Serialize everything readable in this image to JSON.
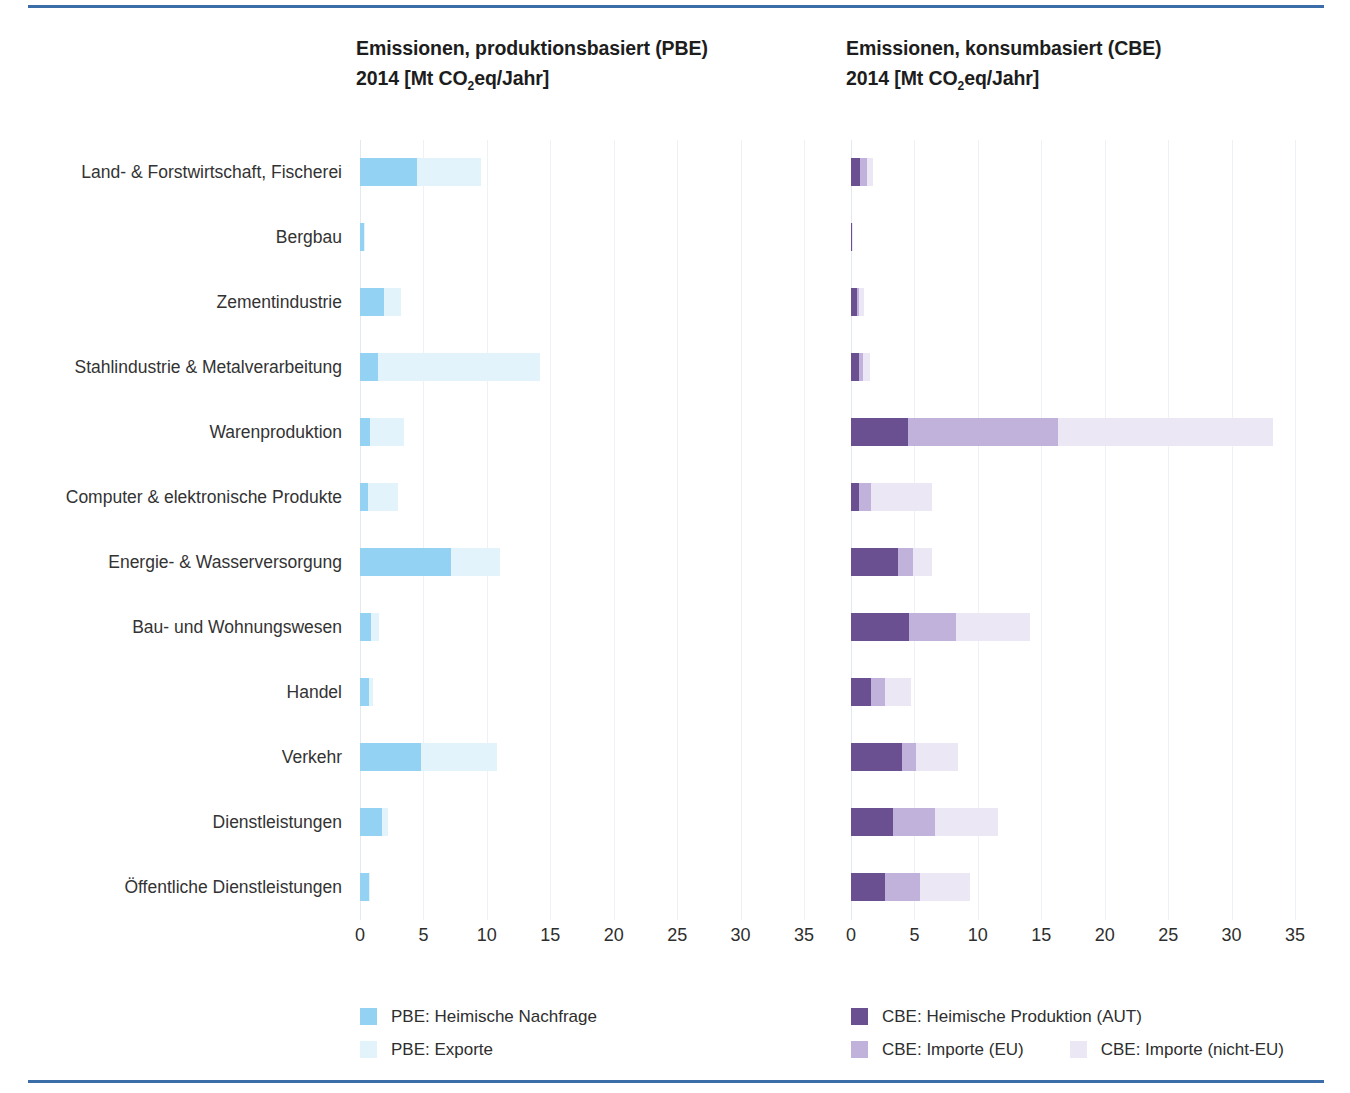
{
  "accent_rule_color": "#3b6ea8",
  "panels": {
    "left": {
      "title_line1": "Emissionen, produktionsbasiert  (PBE)",
      "title_line2_pre": "2014 [Mt CO",
      "title_line2_sub": "2",
      "title_line2_post": "eq/Jahr]"
    },
    "right": {
      "title_line1": "Emissionen, konsumbasiert (CBE)",
      "title_line2_pre": "2014 [Mt CO",
      "title_line2_sub": "2",
      "title_line2_post": "eq/Jahr]"
    }
  },
  "legend": {
    "pbe": [
      {
        "label": "PBE: Heimische Nachfrage",
        "color": "#93d2f2"
      },
      {
        "label": "PBE: Exporte",
        "color": "#e3f3fc"
      }
    ],
    "cbe": [
      {
        "label": "CBE: Heimische Produktion (AUT)",
        "color": "#6a5091"
      },
      {
        "label": "CBE: Importe (EU)",
        "color": "#c0b2da"
      },
      {
        "label": "CBE: Importe (nicht-EU)",
        "color": "#ece7f4"
      }
    ]
  },
  "chart_data": {
    "type": "bar",
    "orientation": "horizontal",
    "stacked": true,
    "xlabel": "Mt CO2eq/Jahr",
    "ylabel": "",
    "xlim": [
      0,
      35
    ],
    "xticks": [
      0,
      5,
      10,
      15,
      20,
      25,
      30,
      35
    ],
    "grid": true,
    "legend_position": "bottom",
    "categories": [
      "Land- & Forstwirtschaft, Fischerei",
      "Bergbau",
      "Zementindustrie",
      "Stahlindustrie & Metalverarbeitung",
      "Warenproduktion",
      "Computer & elektronische Produkte",
      "Energie- & Wasserversorgung",
      "Bau- und Wohnungswesen",
      "Handel",
      "Verkehr",
      "Dienstleistungen",
      "Öffentliche Dienstleistungen"
    ],
    "panels": [
      {
        "name": "PBE",
        "title": "Emissionen, produktionsbasiert (PBE) 2014 [Mt CO2eq/Jahr]",
        "series": [
          {
            "name": "PBE: Heimische Nachfrage",
            "color": "#93d2f2",
            "values": [
              4.5,
              0.3,
              1.9,
              1.4,
              0.8,
              0.6,
              7.2,
              0.9,
              0.7,
              4.8,
              1.7,
              0.7
            ]
          },
          {
            "name": "PBE: Exporte",
            "color": "#e3f3fc",
            "values": [
              5.0,
              0.05,
              1.3,
              12.8,
              2.7,
              2.4,
              3.8,
              0.6,
              0.3,
              6.0,
              0.5,
              0.1
            ]
          }
        ]
      },
      {
        "name": "CBE",
        "title": "Emissionen, konsumbasiert (CBE) 2014 [Mt CO2eq/Jahr]",
        "series": [
          {
            "name": "CBE: Heimische Produktion (AUT)",
            "color": "#6a5091",
            "values": [
              0.7,
              0.08,
              0.5,
              0.6,
              4.5,
              0.65,
              3.7,
              4.6,
              1.6,
              4.0,
              3.3,
              2.7
            ]
          },
          {
            "name": "CBE: Importe (EU)",
            "color": "#c0b2da",
            "values": [
              0.6,
              0.03,
              0.15,
              0.35,
              11.8,
              0.95,
              1.2,
              3.7,
              1.1,
              1.1,
              3.3,
              2.7
            ]
          },
          {
            "name": "CBE: Importe (nicht-EU)",
            "color": "#ece7f4",
            "values": [
              0.4,
              0.02,
              0.4,
              0.55,
              17.0,
              4.8,
              1.5,
              5.8,
              2.0,
              3.3,
              5.0,
              4.0
            ]
          }
        ]
      }
    ]
  }
}
